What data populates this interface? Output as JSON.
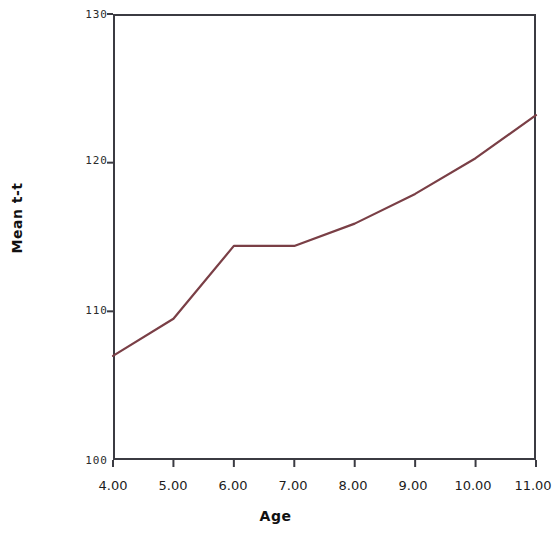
{
  "chart_data": {
    "type": "line",
    "title": "",
    "xlabel": "Age",
    "ylabel": "Mean t-t",
    "x": [
      4,
      5,
      6,
      7,
      8,
      9,
      10,
      11
    ],
    "xtick_labels": [
      "4.00",
      "5.00",
      "6.00",
      "7.00",
      "8.00",
      "9.00",
      "10.00",
      "11.00"
    ],
    "ytick_labels": [
      "100",
      "110",
      "120",
      "130"
    ],
    "ytick_values": [
      100,
      110,
      120,
      130
    ],
    "xlim": [
      4,
      11
    ],
    "ylim": [
      100,
      130
    ],
    "grid": false,
    "legend": null,
    "series": [
      {
        "name": "Mean t-t",
        "color": "#7a3f46",
        "values": [
          107.0,
          109.5,
          114.4,
          114.4,
          115.9,
          117.9,
          120.3,
          123.2
        ]
      }
    ]
  },
  "axes": {
    "x_title": "Age",
    "y_title": "Mean t-t"
  },
  "style": {
    "line_color": "#7a3f46",
    "frame_color": "#3b3b42",
    "tick_color": "#2b2b2b",
    "background": "#ffffff"
  }
}
